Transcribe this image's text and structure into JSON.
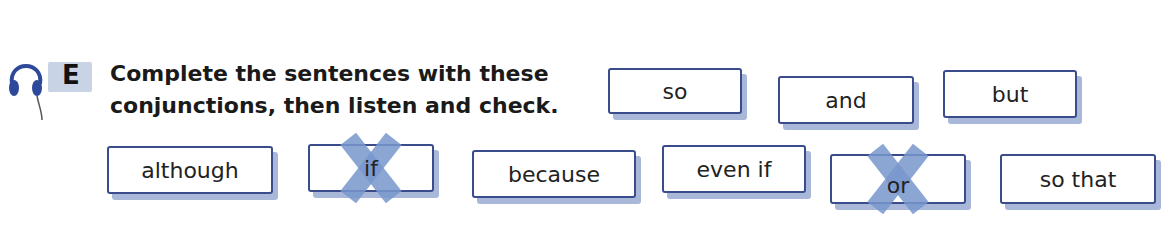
{
  "exercise": {
    "label": "E",
    "audio_icon": "headphones-icon",
    "instruction_line1": "Complete the sentences with these",
    "instruction_line2": "conjunctions, then listen and check."
  },
  "word_box": [
    {
      "text": "so",
      "crossed": false
    },
    {
      "text": "and",
      "crossed": false
    },
    {
      "text": "but",
      "crossed": false
    },
    {
      "text": "although",
      "crossed": false
    },
    {
      "text": "if",
      "crossed": true
    },
    {
      "text": "because",
      "crossed": false
    },
    {
      "text": "even if",
      "crossed": false
    },
    {
      "text": "or",
      "crossed": true
    },
    {
      "text": "so that",
      "crossed": false
    }
  ],
  "colors": {
    "box_border": "#3a4c8c",
    "box_shadow": "#a9b8d8",
    "cross": "#7896cd",
    "label_bg": "#c9d3e6"
  }
}
